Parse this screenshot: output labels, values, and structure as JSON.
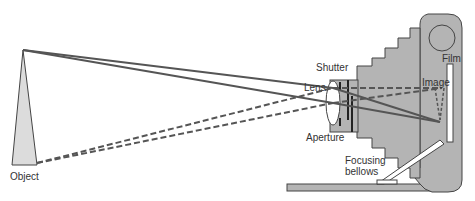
{
  "diagram": {
    "labels": {
      "object": "Object",
      "shutter": "Shutter",
      "lens": "Lens",
      "aperture": "Aperture",
      "image": "Image",
      "film": "Film",
      "focusing_bellows_line1": "Focusing",
      "focusing_bellows_line2": "bellows"
    },
    "colors": {
      "camera_body": "#b4b4b4",
      "object_fill": "#dcdcdc",
      "ray": "#555555",
      "outline": "#444444",
      "text": "#333333"
    }
  }
}
